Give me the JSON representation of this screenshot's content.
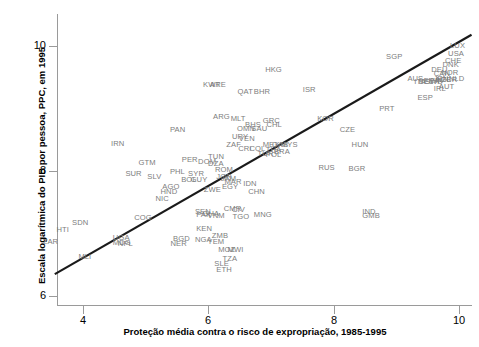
{
  "chart_data": {
    "type": "scatter",
    "title": "",
    "xlabel": "Proteção média contra o risco de expropriação, 1985-1995",
    "ylabel": "Escala logarítmica do PIB por pessoa, PPC, em 1995",
    "xlim": [
      3.3,
      10.6
    ],
    "ylim": [
      5.75,
      10.6
    ],
    "xticks": [
      4,
      6,
      8,
      10
    ],
    "yticks": [
      6,
      8,
      10
    ],
    "xtick_labels": [
      "4",
      "6",
      "8",
      "10"
    ],
    "ytick_labels": [
      "6",
      "8",
      "10"
    ],
    "grid": false,
    "legend": null,
    "marker_style": "text-label",
    "trendline": {
      "type": "linear",
      "x0": 3.55,
      "y0": 6.35,
      "x1": 10.2,
      "y1": 10.18,
      "color": "#1a1a1a"
    },
    "points": [
      {
        "label": "ZAR",
        "x": 3.5,
        "y": 6.87
      },
      {
        "label": "HTI",
        "x": 3.72,
        "y": 7.05
      },
      {
        "label": "SDN",
        "x": 3.97,
        "y": 7.17
      },
      {
        "label": "MLI",
        "x": 4.07,
        "y": 6.62
      },
      {
        "label": "UGA",
        "x": 4.62,
        "y": 6.93
      },
      {
        "label": "MDG",
        "x": 4.62,
        "y": 6.85
      },
      {
        "label": "NPL",
        "x": 4.7,
        "y": 6.84
      },
      {
        "label": "SUR",
        "x": 4.82,
        "y": 7.95
      },
      {
        "label": "GTM",
        "x": 5.03,
        "y": 8.13
      },
      {
        "label": "IRN",
        "x": 4.59,
        "y": 8.43
      },
      {
        "label": "COG",
        "x": 4.96,
        "y": 7.25
      },
      {
        "label": "SLV",
        "x": 5.17,
        "y": 7.9
      },
      {
        "label": "NIC",
        "x": 5.3,
        "y": 7.56
      },
      {
        "label": "HND",
        "x": 5.38,
        "y": 7.66
      },
      {
        "label": "AGO",
        "x": 5.41,
        "y": 7.74
      },
      {
        "label": "BGD",
        "x": 5.58,
        "y": 6.92
      },
      {
        "label": "NER",
        "x": 5.54,
        "y": 6.83
      },
      {
        "label": "PHL",
        "x": 5.53,
        "y": 7.98
      },
      {
        "label": "BOL",
        "x": 5.71,
        "y": 7.86
      },
      {
        "label": "GUY",
        "x": 5.86,
        "y": 7.86
      },
      {
        "label": "SYR",
        "x": 5.82,
        "y": 7.95
      },
      {
        "label": "NGA",
        "x": 5.93,
        "y": 6.9
      },
      {
        "label": "KEN",
        "x": 5.95,
        "y": 7.08
      },
      {
        "label": "SEN",
        "x": 5.93,
        "y": 7.35
      },
      {
        "label": "PAK",
        "x": 5.95,
        "y": 7.3
      },
      {
        "label": "GHA",
        "x": 6.05,
        "y": 7.32
      },
      {
        "label": "ZWE",
        "x": 6.07,
        "y": 7.7
      },
      {
        "label": "VNM",
        "x": 6.13,
        "y": 7.28
      },
      {
        "label": "ZMB",
        "x": 6.2,
        "y": 6.96
      },
      {
        "label": "YEM",
        "x": 6.13,
        "y": 6.86
      },
      {
        "label": "MOZ",
        "x": 6.3,
        "y": 6.74
      },
      {
        "label": "MWI",
        "x": 6.45,
        "y": 6.74
      },
      {
        "label": "TZA",
        "x": 6.37,
        "y": 6.6
      },
      {
        "label": "SLE",
        "x": 6.24,
        "y": 6.52
      },
      {
        "label": "ETH",
        "x": 6.27,
        "y": 6.42
      },
      {
        "label": "CMR",
        "x": 6.39,
        "y": 7.39
      },
      {
        "label": "CIV",
        "x": 6.52,
        "y": 7.38
      },
      {
        "label": "TGO",
        "x": 6.53,
        "y": 7.26
      },
      {
        "label": "EGY",
        "x": 6.36,
        "y": 7.75
      },
      {
        "label": "MAR",
        "x": 6.4,
        "y": 7.82
      },
      {
        "label": "JAM",
        "x": 6.34,
        "y": 7.87
      },
      {
        "label": "JOR",
        "x": 6.27,
        "y": 7.9
      },
      {
        "label": "IDN",
        "x": 6.7,
        "y": 7.8
      },
      {
        "label": "CHN",
        "x": 6.78,
        "y": 7.66
      },
      {
        "label": "MNG",
        "x": 6.87,
        "y": 7.3
      },
      {
        "label": "ROM",
        "x": 6.25,
        "y": 8.02
      },
      {
        "label": "DOM",
        "x": 5.98,
        "y": 8.15
      },
      {
        "label": "PER",
        "x": 5.72,
        "y": 8.17
      },
      {
        "label": "TUN",
        "x": 6.14,
        "y": 8.22
      },
      {
        "label": "DZA",
        "x": 6.14,
        "y": 8.12
      },
      {
        "label": "PAN",
        "x": 5.53,
        "y": 8.66
      },
      {
        "label": "ARG",
        "x": 6.22,
        "y": 8.87
      },
      {
        "label": "ZAF",
        "x": 6.43,
        "y": 8.42
      },
      {
        "label": "CRI",
        "x": 6.62,
        "y": 8.35
      },
      {
        "label": "COL",
        "x": 6.8,
        "y": 8.35
      },
      {
        "label": "URY",
        "x": 6.52,
        "y": 8.55
      },
      {
        "label": "VEN",
        "x": 6.63,
        "y": 8.52
      },
      {
        "label": "TUR",
        "x": 6.93,
        "y": 8.27
      },
      {
        "label": "POL",
        "x": 7.06,
        "y": 8.25
      },
      {
        "label": "THA",
        "x": 7.06,
        "y": 8.34
      },
      {
        "label": "BRA",
        "x": 7.19,
        "y": 8.3
      },
      {
        "label": "MEX",
        "x": 7.01,
        "y": 8.42
      },
      {
        "label": "GAB",
        "x": 7.16,
        "y": 8.42
      },
      {
        "label": "MYS",
        "x": 7.3,
        "y": 8.41
      },
      {
        "label": "BHS",
        "x": 6.73,
        "y": 8.73
      },
      {
        "label": "SAU",
        "x": 6.83,
        "y": 8.68
      },
      {
        "label": "GRC",
        "x": 7.01,
        "y": 8.8
      },
      {
        "label": "CHL",
        "x": 7.07,
        "y": 8.73
      },
      {
        "label": "OMN",
        "x": 6.6,
        "y": 8.68
      },
      {
        "label": "MLT",
        "x": 6.5,
        "y": 8.83
      },
      {
        "label": "QAT",
        "x": 6.61,
        "y": 9.27
      },
      {
        "label": "BHR",
        "x": 6.87,
        "y": 9.27
      },
      {
        "label": "KWT",
        "x": 6.06,
        "y": 9.38
      },
      {
        "label": "ARE",
        "x": 6.17,
        "y": 9.38
      },
      {
        "label": "HKG",
        "x": 7.05,
        "y": 9.62
      },
      {
        "label": "ISR",
        "x": 7.65,
        "y": 9.3
      },
      {
        "label": "KOR",
        "x": 7.88,
        "y": 8.83
      },
      {
        "label": "CZE",
        "x": 8.24,
        "y": 8.65
      },
      {
        "label": "HUN",
        "x": 8.43,
        "y": 8.42
      },
      {
        "label": "RUS",
        "x": 7.9,
        "y": 8.05
      },
      {
        "label": "BGR",
        "x": 8.38,
        "y": 8.03
      },
      {
        "label": "IND",
        "x": 8.6,
        "y": 7.34
      },
      {
        "label": "GMB",
        "x": 8.6,
        "y": 7.28
      },
      {
        "label": "PRT",
        "x": 8.87,
        "y": 9.0
      },
      {
        "label": "ESP",
        "x": 9.48,
        "y": 9.17
      },
      {
        "label": "SGP",
        "x": 8.98,
        "y": 9.83
      },
      {
        "label": "AUS",
        "x": 9.32,
        "y": 9.48
      },
      {
        "label": "ITA",
        "x": 9.43,
        "y": 9.43
      },
      {
        "label": "BEL",
        "x": 9.5,
        "y": 9.42
      },
      {
        "label": "FRA",
        "x": 9.58,
        "y": 9.44
      },
      {
        "label": "SWE",
        "x": 9.6,
        "y": 9.43
      },
      {
        "label": "FIN",
        "x": 9.69,
        "y": 9.44
      },
      {
        "label": "JPN",
        "x": 9.74,
        "y": 9.47
      },
      {
        "label": "NZL",
        "x": 9.78,
        "y": 9.45
      },
      {
        "label": "GBR",
        "x": 9.85,
        "y": 9.46
      },
      {
        "label": "NLD",
        "x": 9.98,
        "y": 9.47
      },
      {
        "label": "CAN",
        "x": 9.74,
        "y": 9.56
      },
      {
        "label": "NOR",
        "x": 9.86,
        "y": 9.57
      },
      {
        "label": "IRL",
        "x": 9.74,
        "y": 9.32
      },
      {
        "label": "AUT",
        "x": 9.82,
        "y": 9.34
      },
      {
        "label": "DEU",
        "x": 9.7,
        "y": 9.62
      },
      {
        "label": "DNK",
        "x": 9.88,
        "y": 9.7
      },
      {
        "label": "CHE",
        "x": 9.92,
        "y": 9.76
      },
      {
        "label": "USA",
        "x": 9.97,
        "y": 9.88
      },
      {
        "label": "LUX",
        "x": 10.0,
        "y": 10.0
      }
    ]
  },
  "axes": {
    "y_title": "Escala logarítmica do PIB por pessoa, PPC, em 1995",
    "x_title": "Proteção média contra o risco de expropriação, 1985-1995"
  }
}
